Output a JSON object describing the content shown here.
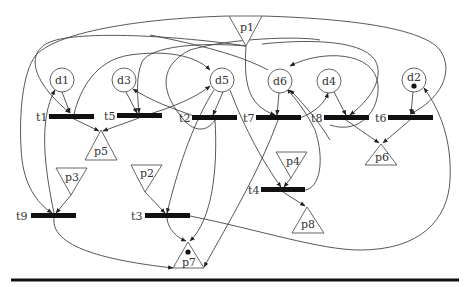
{
  "diagram": {
    "type": "petri-net",
    "places_circle": [
      {
        "id": "d1",
        "label": "d1",
        "cx": 62,
        "cy": 80,
        "tokens": 0
      },
      {
        "id": "d3",
        "label": "d3",
        "cx": 124,
        "cy": 80,
        "tokens": 0
      },
      {
        "id": "d5",
        "label": "d5",
        "cx": 222,
        "cy": 80,
        "tokens": 0
      },
      {
        "id": "d6",
        "label": "d6",
        "cx": 280,
        "cy": 81,
        "tokens": 0
      },
      {
        "id": "d4",
        "label": "d4",
        "cx": 329,
        "cy": 81,
        "tokens": 0
      },
      {
        "id": "d2",
        "label": "d2",
        "cx": 414,
        "cy": 80,
        "tokens": 1
      }
    ],
    "places_triangle": [
      {
        "id": "p1",
        "label": "p1",
        "orientation": "down",
        "tokens": 0
      },
      {
        "id": "p2",
        "label": "p2",
        "orientation": "down",
        "tokens": 0
      },
      {
        "id": "p3",
        "label": "p3",
        "orientation": "down",
        "tokens": 0
      },
      {
        "id": "p4",
        "label": "p4",
        "orientation": "down",
        "tokens": 0
      },
      {
        "id": "p5",
        "label": "p5",
        "orientation": "up",
        "tokens": 0
      },
      {
        "id": "p6",
        "label": "p6",
        "orientation": "up",
        "tokens": 0
      },
      {
        "id": "p7",
        "label": "p7",
        "orientation": "up",
        "tokens": 1
      },
      {
        "id": "p8",
        "label": "p8",
        "orientation": "up",
        "tokens": 0
      }
    ],
    "transitions": [
      {
        "id": "t1",
        "label": "t1"
      },
      {
        "id": "t2",
        "label": "t2"
      },
      {
        "id": "t3",
        "label": "t3"
      },
      {
        "id": "t4",
        "label": "t4"
      },
      {
        "id": "t5",
        "label": "t5"
      },
      {
        "id": "t6",
        "label": "t6"
      },
      {
        "id": "t7",
        "label": "t7"
      },
      {
        "id": "t8",
        "label": "t8"
      },
      {
        "id": "t9",
        "label": "t9"
      }
    ],
    "arcs": [
      {
        "from": "d1",
        "to": "t1"
      },
      {
        "from": "t1",
        "to": "p5"
      },
      {
        "from": "d3",
        "to": "t5"
      },
      {
        "from": "t5",
        "to": "p5"
      },
      {
        "from": "d5",
        "to": "t2"
      },
      {
        "from": "d6",
        "to": "t7"
      },
      {
        "from": "d4",
        "to": "t8"
      },
      {
        "from": "d2",
        "to": "t6"
      },
      {
        "from": "t8",
        "to": "p6"
      },
      {
        "from": "t6",
        "to": "p6"
      },
      {
        "from": "p3",
        "to": "t9"
      },
      {
        "from": "p2",
        "to": "t3"
      },
      {
        "from": "p4",
        "to": "t4"
      },
      {
        "from": "t4",
        "to": "p8"
      },
      {
        "from": "t3",
        "to": "p7"
      },
      {
        "from": "t9",
        "to": "p7"
      },
      {
        "from": "t9",
        "to": "d1"
      },
      {
        "from": "t5",
        "to": "d5"
      },
      {
        "from": "t2",
        "to": "d3"
      },
      {
        "from": "t7",
        "to": "d4"
      },
      {
        "from": "t4",
        "to": "d6"
      },
      {
        "from": "p1",
        "to": "t7"
      },
      {
        "from": "p1",
        "to": "t1"
      },
      {
        "from": "p1",
        "to": "t6"
      },
      {
        "from": "p1",
        "to": "t9"
      },
      {
        "from": "t3",
        "to": "d2"
      },
      {
        "from": "t8",
        "to": "d6"
      },
      {
        "from": "t2",
        "to": "t4"
      },
      {
        "from": "d5",
        "to": "p7"
      }
    ]
  },
  "labels": {
    "p1": "p1",
    "p2": "p2",
    "p3": "p3",
    "p4": "p4",
    "p5": "p5",
    "p6": "p6",
    "p7": "p7",
    "p8": "p8",
    "d1": "d1",
    "d2": "d2",
    "d3": "d3",
    "d4": "d4",
    "d5": "d5",
    "d6": "d6",
    "t1": "t1",
    "t2": "t2",
    "t3": "t3",
    "t4": "t4",
    "t5": "t5",
    "t6": "t6",
    "t7": "t7",
    "t8": "t8",
    "t9": "t9"
  },
  "colors": {
    "background": "#ffffff",
    "stroke": "#444444",
    "transition_fill": "#111111",
    "rule": "#111111"
  }
}
